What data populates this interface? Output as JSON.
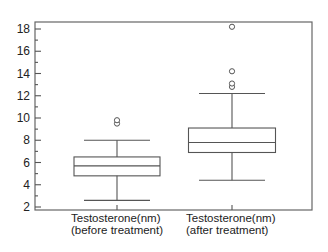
{
  "chart_data": {
    "type": "boxplot",
    "title": "",
    "xlabel": "",
    "ylabel": "",
    "ylim": [
      1.5,
      18.7
    ],
    "yticks": [
      2,
      4,
      6,
      8,
      10,
      12,
      14,
      16,
      18
    ],
    "ytick_labels": [
      "2",
      "4",
      "6",
      "8",
      "10",
      "12",
      "14",
      "16",
      "18"
    ],
    "grid": false,
    "legend": "none",
    "categories": [
      [
        "Testosterone(nm)",
        "(before treatment)"
      ],
      [
        "Testosterone(nm)",
        "(after treatment)"
      ]
    ],
    "boxes": [
      {
        "name": "before treatment",
        "whisker_low": 2.6,
        "q1": 4.8,
        "median": 5.7,
        "q3": 6.5,
        "whisker_high": 8.0,
        "outliers": [
          9.5,
          9.8
        ]
      },
      {
        "name": "after treatment",
        "whisker_low": 4.4,
        "q1": 6.9,
        "median": 7.8,
        "q3": 9.1,
        "whisker_high": 12.2,
        "outliers": [
          12.8,
          13.1,
          14.2,
          18.2
        ]
      }
    ]
  }
}
